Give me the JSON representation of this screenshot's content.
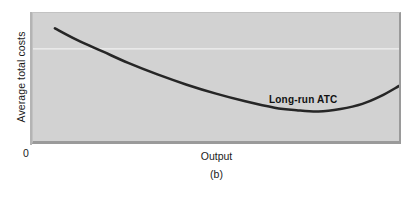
{
  "figure": {
    "caption": "(b)",
    "origin_label": "0",
    "panel_background": "#d2d2d2",
    "page_background": "#ffffff"
  },
  "axes": {
    "y_label": "Average total costs",
    "x_label": "Output"
  },
  "annotations": {
    "curve_label": "Long-run ATC"
  },
  "chart_data": {
    "type": "line",
    "title": "",
    "subtitle": "",
    "caption": "(b)",
    "xlabel": "Output",
    "ylabel": "Average total costs",
    "xlim": [
      0,
      100
    ],
    "ylim": [
      0,
      100
    ],
    "grid": false,
    "legend_position": "inline-annotation",
    "axis_tick_labels": {
      "x": [
        "0"
      ],
      "y": [
        "0"
      ]
    },
    "series": [
      {
        "name": "Long-run ATC",
        "color": "#262626",
        "line_width": 2.6,
        "shape": "u-shaped average total cost curve",
        "points": [
          {
            "x": 6,
            "y": 88
          },
          {
            "x": 12,
            "y": 79
          },
          {
            "x": 19,
            "y": 70
          },
          {
            "x": 26,
            "y": 61
          },
          {
            "x": 34,
            "y": 52
          },
          {
            "x": 42,
            "y": 44
          },
          {
            "x": 50,
            "y": 37
          },
          {
            "x": 58,
            "y": 31
          },
          {
            "x": 66,
            "y": 26
          },
          {
            "x": 72,
            "y": 24
          },
          {
            "x": 78,
            "y": 23
          },
          {
            "x": 84,
            "y": 25
          },
          {
            "x": 90,
            "y": 29
          },
          {
            "x": 95,
            "y": 35
          },
          {
            "x": 100,
            "y": 43
          }
        ],
        "minimum_point": {
          "x": 78,
          "y": 23
        }
      }
    ],
    "annotations": [
      {
        "text": "Long-run ATC",
        "x": 62,
        "y": 47,
        "bold": true
      }
    ]
  }
}
